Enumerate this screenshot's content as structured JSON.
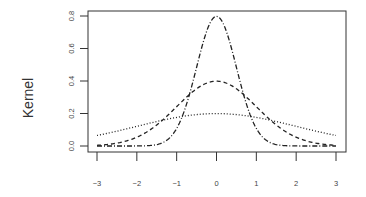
{
  "chart_data": {
    "type": "line",
    "title": "",
    "xlabel": "",
    "ylabel": "Kernel",
    "xlim": [
      -3,
      3
    ],
    "ylim": [
      0,
      0.8
    ],
    "xticks": [
      "-3",
      "-2",
      "-1",
      "0",
      "1",
      "2",
      "3"
    ],
    "yticks": [
      "0.0",
      "0.2",
      "0.4",
      "0.6",
      "0.8"
    ],
    "grid": false,
    "legend": null,
    "series": [
      {
        "name": "kernel sd=0.5",
        "style": "dotdash",
        "x": [
          -3,
          -2.5,
          -2,
          -1.5,
          -1,
          -0.75,
          -0.5,
          -0.25,
          0,
          0.25,
          0.5,
          0.75,
          1,
          1.5,
          2,
          2.5,
          3
        ],
        "values": [
          0.0,
          0.0,
          0.0001,
          0.0036,
          0.108,
          0.259,
          0.484,
          0.704,
          0.798,
          0.704,
          0.484,
          0.259,
          0.108,
          0.0036,
          0.0001,
          0.0,
          0.0
        ]
      },
      {
        "name": "kernel sd=1",
        "style": "dashed",
        "x": [
          -3,
          -2.5,
          -2,
          -1.5,
          -1,
          -0.5,
          0,
          0.5,
          1,
          1.5,
          2,
          2.5,
          3
        ],
        "values": [
          0.004,
          0.018,
          0.054,
          0.13,
          0.242,
          0.352,
          0.399,
          0.352,
          0.242,
          0.13,
          0.054,
          0.018,
          0.004
        ]
      },
      {
        "name": "kernel sd=2",
        "style": "dotted",
        "x": [
          -3,
          -2,
          -1,
          0,
          1,
          2,
          3
        ],
        "values": [
          0.065,
          0.121,
          0.176,
          0.199,
          0.176,
          0.121,
          0.065
        ]
      }
    ]
  }
}
